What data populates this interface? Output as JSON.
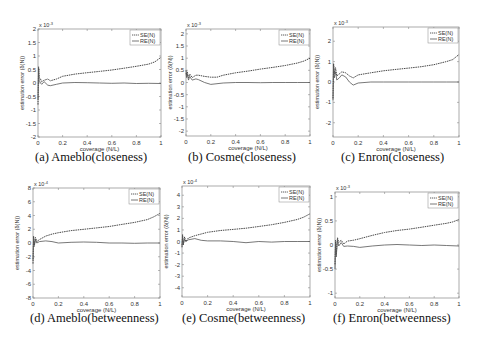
{
  "figure": {
    "legend": [
      "SE(N)",
      "RE(N)"
    ],
    "colors": {
      "se": "#333333",
      "re": "#555555",
      "axes": "#888888",
      "text": "#333333"
    }
  },
  "chart_data": [
    {
      "type": "line",
      "caption": "(a)  Ameblo(closeness)",
      "exponent": "x 10^-3",
      "exp_base": "x 10",
      "exp_pow": "-3",
      "xlabel": "coverage (N/L)",
      "ylabel": "estimation error (δ(N))",
      "xlim": [
        0,
        1
      ],
      "ylim": [
        -2,
        2
      ],
      "xticks": [
        0,
        0.2,
        0.4,
        0.6,
        0.8,
        1
      ],
      "yticks": [
        -2,
        -1.5,
        -1,
        -0.5,
        0,
        0.5,
        1,
        1.5,
        2
      ],
      "frame": {
        "x": 38,
        "y": 29,
        "w": 123,
        "h": 108
      },
      "caption_pos": {
        "x": 35,
        "y": 150
      },
      "series": [
        {
          "name": "SE(N)",
          "x": [
            0,
            0.005,
            0.01,
            0.02,
            0.03,
            0.05,
            0.08,
            0.1,
            0.15,
            0.2,
            0.3,
            0.4,
            0.5,
            0.6,
            0.7,
            0.8,
            0.9,
            0.95,
            1
          ],
          "y": [
            -0.8,
            0.6,
            0.2,
            0.15,
            0.05,
            0.1,
            0.15,
            0.08,
            0.15,
            0.25,
            0.33,
            0.38,
            0.43,
            0.48,
            0.55,
            0.62,
            0.7,
            0.78,
            0.95
          ]
        },
        {
          "name": "RE(N)",
          "x": [
            0,
            0.005,
            0.01,
            0.02,
            0.03,
            0.05,
            0.08,
            0.1,
            0.15,
            0.2,
            0.3,
            0.4,
            0.5,
            0.6,
            0.7,
            0.8,
            0.9,
            1
          ],
          "y": [
            -0.6,
            0.5,
            0.1,
            0.0,
            -0.05,
            0.05,
            -0.08,
            -0.1,
            -0.05,
            0.0,
            0.02,
            0.01,
            0.0,
            -0.01,
            0.0,
            -0.02,
            -0.01,
            -0.02
          ]
        }
      ]
    },
    {
      "type": "line",
      "caption": "(b)  Cosme(closeness)",
      "exponent": "x 10^-3",
      "exp_base": "x 10",
      "exp_pow": "-3",
      "xlabel": "coverage (N/L)",
      "ylabel": "estimation error (δ(N))",
      "xlim": [
        0,
        1
      ],
      "ylim": [
        -2.2,
        2.2
      ],
      "xticks": [
        0,
        0.2,
        0.4,
        0.6,
        0.8,
        1
      ],
      "yticks": [
        -2,
        -1.5,
        -1,
        -0.5,
        0,
        0.5,
        1,
        1.5,
        2
      ],
      "frame": {
        "x": 186,
        "y": 29,
        "w": 124,
        "h": 107
      },
      "caption_pos": {
        "x": 188,
        "y": 150
      },
      "series": [
        {
          "name": "SE(N)",
          "x": [
            0,
            0.005,
            0.01,
            0.02,
            0.03,
            0.05,
            0.08,
            0.1,
            0.15,
            0.2,
            0.25,
            0.3,
            0.4,
            0.5,
            0.6,
            0.7,
            0.8,
            0.9,
            0.95,
            1
          ],
          "y": [
            0.5,
            0.3,
            0.45,
            0.2,
            0.35,
            0.2,
            0.3,
            0.3,
            0.25,
            0.22,
            0.22,
            0.3,
            0.4,
            0.47,
            0.55,
            0.62,
            0.7,
            0.8,
            0.88,
            1.0
          ]
        },
        {
          "name": "RE(N)",
          "x": [
            0,
            0.005,
            0.01,
            0.02,
            0.03,
            0.05,
            0.08,
            0.1,
            0.15,
            0.2,
            0.25,
            0.3,
            0.4,
            0.5,
            0.6,
            0.7,
            0.8,
            0.9,
            1
          ],
          "y": [
            0.4,
            0.2,
            0.35,
            0.1,
            0.25,
            0.1,
            0.15,
            0.12,
            0.0,
            -0.08,
            -0.05,
            -0.02,
            0.0,
            0.0,
            -0.01,
            0.0,
            0.0,
            0.0,
            0.0
          ]
        }
      ]
    },
    {
      "type": "line",
      "caption": "(c)  Enron(closeness)",
      "exponent": "x 10^-3",
      "exp_base": "x 10",
      "exp_pow": "-3",
      "xlabel": "coverage (N/L)",
      "ylabel": "estimation error (δ(N))",
      "xlim": [
        0,
        1
      ],
      "ylim": [
        -2.7,
        2.7
      ],
      "xticks": [
        0,
        0.2,
        0.4,
        0.6,
        0.8,
        1
      ],
      "yticks": [
        -2,
        -1,
        0,
        1,
        2
      ],
      "frame": {
        "x": 333,
        "y": 27,
        "w": 126,
        "h": 110
      },
      "caption_pos": {
        "x": 341,
        "y": 150
      },
      "series": [
        {
          "name": "SE(N)",
          "x": [
            0,
            0.005,
            0.01,
            0.02,
            0.03,
            0.05,
            0.07,
            0.1,
            0.13,
            0.16,
            0.2,
            0.3,
            0.4,
            0.5,
            0.6,
            0.7,
            0.8,
            0.9,
            0.95,
            1
          ],
          "y": [
            -0.8,
            0.9,
            0.4,
            0.7,
            0.3,
            0.4,
            0.5,
            0.45,
            0.3,
            0.2,
            0.35,
            0.45,
            0.55,
            0.62,
            0.68,
            0.75,
            0.85,
            1.0,
            1.1,
            1.35
          ]
        },
        {
          "name": "RE(N)",
          "x": [
            0,
            0.005,
            0.01,
            0.02,
            0.03,
            0.05,
            0.07,
            0.1,
            0.13,
            0.16,
            0.2,
            0.3,
            0.4,
            0.5,
            0.6,
            0.7,
            0.8,
            0.9,
            1
          ],
          "y": [
            -0.9,
            0.8,
            0.2,
            0.5,
            0.1,
            0.2,
            0.35,
            0.25,
            0.0,
            -0.15,
            -0.05,
            0.0,
            0.0,
            0.0,
            0.0,
            0.0,
            0.0,
            0.0,
            0.0
          ]
        }
      ]
    },
    {
      "type": "line",
      "caption": "(d)  Ameblo(betweenness)",
      "exponent": "x 10^-4",
      "exp_base": "x 10",
      "exp_pow": "-4",
      "xlabel": "coverage (N/L)",
      "ylabel": "estimation error (δ(N))",
      "xlim": [
        0,
        1
      ],
      "ylim": [
        -8,
        8
      ],
      "xticks": [
        0,
        0.2,
        0.4,
        0.6,
        0.8,
        1
      ],
      "yticks": [
        -8,
        -6,
        -4,
        -2,
        0,
        2,
        4,
        6,
        8
      ],
      "frame": {
        "x": 33,
        "y": 188,
        "w": 127,
        "h": 110
      },
      "caption_pos": {
        "x": 30,
        "y": 311
      },
      "series": [
        {
          "name": "SE(N)",
          "x": [
            0,
            0.005,
            0.01,
            0.02,
            0.03,
            0.05,
            0.1,
            0.15,
            0.2,
            0.3,
            0.4,
            0.5,
            0.6,
            0.7,
            0.8,
            0.9,
            0.95,
            1
          ],
          "y": [
            -3,
            1.0,
            -0.5,
            0.8,
            0.2,
            0.5,
            1.0,
            1.3,
            1.5,
            1.8,
            2.0,
            2.2,
            2.4,
            2.7,
            3.0,
            3.4,
            3.8,
            4.3
          ]
        },
        {
          "name": "RE(N)",
          "x": [
            0,
            0.005,
            0.01,
            0.02,
            0.03,
            0.05,
            0.1,
            0.15,
            0.2,
            0.3,
            0.4,
            0.5,
            0.6,
            0.7,
            0.8,
            0.9,
            1
          ],
          "y": [
            -2.5,
            0.8,
            -0.3,
            0.5,
            0.0,
            0.2,
            0.3,
            0.2,
            0.0,
            0.1,
            0.15,
            0.1,
            0.0,
            0.0,
            -0.05,
            0.0,
            0.0
          ]
        }
      ]
    },
    {
      "type": "line",
      "caption": "(e)  Cosme(betweenness)",
      "exponent": "x 10^-4",
      "exp_base": "x 10",
      "exp_pow": "-4",
      "xlabel": "coverage (N/L)",
      "ylabel": "estimation error (δ(N))",
      "xlim": [
        0,
        1
      ],
      "ylim": [
        -4.8,
        4.8
      ],
      "xticks": [
        0,
        0.2,
        0.4,
        0.6,
        0.8,
        1
      ],
      "yticks": [
        -4,
        -3,
        -2,
        -1,
        0,
        1,
        2,
        3,
        4
      ],
      "frame": {
        "x": 182,
        "y": 186,
        "w": 128,
        "h": 111
      },
      "caption_pos": {
        "x": 182,
        "y": 311
      },
      "series": [
        {
          "name": "SE(N)",
          "x": [
            0,
            0.005,
            0.01,
            0.02,
            0.03,
            0.05,
            0.1,
            0.15,
            0.2,
            0.3,
            0.4,
            0.5,
            0.6,
            0.7,
            0.8,
            0.9,
            0.95,
            1
          ],
          "y": [
            -0.5,
            0.6,
            -0.3,
            0.4,
            0.0,
            0.3,
            0.5,
            0.65,
            0.8,
            0.95,
            1.05,
            1.15,
            1.3,
            1.45,
            1.65,
            1.9,
            2.1,
            2.4
          ]
        },
        {
          "name": "RE(N)",
          "x": [
            0,
            0.005,
            0.01,
            0.02,
            0.03,
            0.05,
            0.1,
            0.15,
            0.2,
            0.3,
            0.4,
            0.5,
            0.6,
            0.7,
            0.8,
            0.9,
            1
          ],
          "y": [
            -0.4,
            0.4,
            -0.2,
            0.2,
            0.0,
            0.15,
            0.25,
            0.1,
            0.05,
            0.05,
            0.0,
            -0.1,
            0.0,
            -0.05,
            0.0,
            0.0,
            0.0
          ]
        }
      ]
    },
    {
      "type": "line",
      "caption": "(f)  Enron(betweenness)",
      "exponent": "x 10^-3",
      "exp_base": "x 10",
      "exp_pow": "-3",
      "xlabel": "coverage (N/L)",
      "ylabel": "estimation error (δ(N))",
      "xlim": [
        0,
        1
      ],
      "ylim": [
        -1.1,
        1.1
      ],
      "xticks": [
        0,
        0.2,
        0.4,
        0.6,
        0.8,
        1
      ],
      "yticks": [
        -1,
        -0.5,
        0,
        0.5,
        1
      ],
      "frame": {
        "x": 335,
        "y": 192,
        "w": 124,
        "h": 106
      },
      "caption_pos": {
        "x": 333,
        "y": 311
      },
      "series": [
        {
          "name": "SE(N)",
          "x": [
            0,
            0.005,
            0.01,
            0.02,
            0.03,
            0.05,
            0.07,
            0.1,
            0.15,
            0.2,
            0.3,
            0.4,
            0.5,
            0.6,
            0.7,
            0.8,
            0.9,
            0.95,
            1
          ],
          "y": [
            -0.4,
            0.1,
            -0.2,
            0.15,
            0.05,
            0.1,
            0.02,
            0.08,
            0.1,
            0.13,
            0.2,
            0.26,
            0.3,
            0.33,
            0.37,
            0.41,
            0.45,
            0.48,
            0.53
          ]
        },
        {
          "name": "RE(N)",
          "x": [
            0,
            0.005,
            0.01,
            0.02,
            0.03,
            0.05,
            0.07,
            0.1,
            0.15,
            0.2,
            0.3,
            0.4,
            0.5,
            0.6,
            0.7,
            0.8,
            0.9,
            1
          ],
          "y": [
            -0.5,
            0.05,
            -0.25,
            0.1,
            -0.02,
            0.05,
            -0.03,
            -0.02,
            -0.03,
            -0.05,
            -0.02,
            0.0,
            0.01,
            0.0,
            -0.01,
            0.0,
            -0.01,
            -0.02
          ]
        }
      ]
    }
  ]
}
